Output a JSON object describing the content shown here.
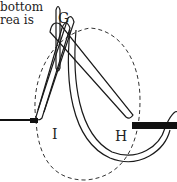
{
  "text_fragment": {
    "line1": "bottom",
    "line2": "rea is"
  },
  "labels": {
    "g": "G",
    "i": "I",
    "h": "H"
  },
  "diagram": {
    "stroke_color": "#1a1a1a",
    "background": "#ffffff"
  }
}
